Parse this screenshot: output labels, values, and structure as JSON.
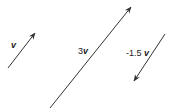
{
  "diagram": {
    "colors": {
      "line": "#333333",
      "text": "#222222",
      "background": "#ffffff"
    },
    "vectors": [
      {
        "id": "v",
        "label_coef": "",
        "label_var": "v",
        "tail": [
          8,
          68
        ],
        "head": [
          35,
          33
        ],
        "label_pos": [
          12,
          41
        ]
      },
      {
        "id": "3v",
        "label_coef": "3",
        "label_var": "v",
        "tail": [
          50,
          108
        ],
        "head": [
          131,
          7
        ],
        "label_pos": [
          79,
          47
        ]
      },
      {
        "id": "-1.5v",
        "label_coef": "-1.5 ",
        "label_var": "v",
        "tail": [
          165,
          34
        ],
        "head": [
          134,
          81
        ],
        "label_pos": [
          126,
          49
        ]
      }
    ]
  }
}
